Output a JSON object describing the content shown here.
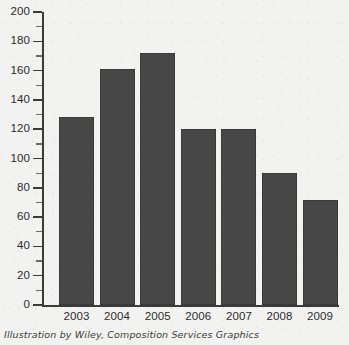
{
  "chart_data": {
    "type": "bar",
    "title": "",
    "subtitle": "",
    "xlabel": "",
    "ylabel": "",
    "categories": [
      "2003",
      "2004",
      "2005",
      "2006",
      "2007",
      "2008",
      "2009"
    ],
    "values": [
      128,
      161,
      172,
      120,
      120,
      90,
      72
    ],
    "ylim": [
      0,
      200
    ],
    "ytick_step": 20,
    "yticks": [
      0,
      20,
      40,
      60,
      80,
      100,
      120,
      140,
      160,
      180,
      200
    ],
    "ytick_labels": [
      "0",
      "20",
      "40",
      "60",
      "80",
      "100",
      "120",
      "140",
      "160",
      "180",
      "200"
    ],
    "minor_tick_step": 10,
    "minor_ticks": [
      10,
      30,
      50,
      70,
      90,
      110,
      130,
      150,
      170,
      190
    ],
    "grid": false,
    "legend": null,
    "legend_position": "none",
    "bar_color": "#474747",
    "axis_color": "#3b3b3b",
    "background_color": "#f2f2f0"
  },
  "caption": {
    "text": "Illustration by Wiley, Composition Services Graphics"
  }
}
